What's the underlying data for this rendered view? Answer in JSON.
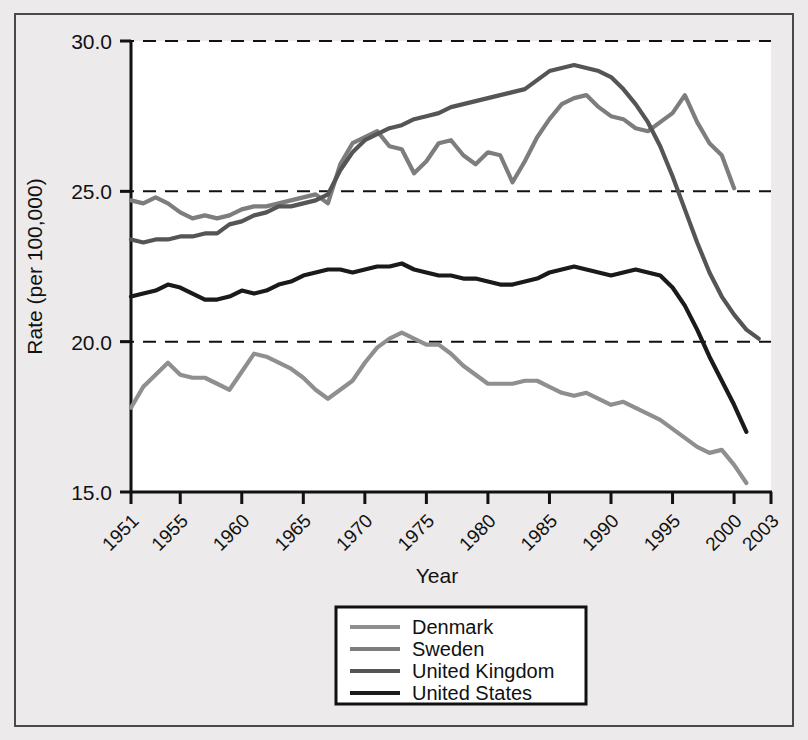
{
  "chart_data": {
    "type": "line",
    "title": "",
    "xlabel": "Year",
    "ylabel": "Rate (per 100,000)",
    "xlim": [
      1951,
      2003
    ],
    "ylim": [
      15.0,
      30.0
    ],
    "grid": true,
    "gridlines_y": [
      15.0,
      20.0,
      25.0,
      30.0
    ],
    "y_tick_labels": [
      "30.0",
      "25.0",
      "20.0",
      "15.0"
    ],
    "y_ticks": [
      30.0,
      25.0,
      20.0,
      15.0
    ],
    "x_tick_labels": [
      "1951",
      "1955",
      "1960",
      "1965",
      "1970",
      "1975",
      "1980",
      "1985",
      "1990",
      "1995",
      "2000",
      "2003"
    ],
    "x_ticks": [
      1951,
      1955,
      1960,
      1965,
      1970,
      1975,
      1980,
      1985,
      1990,
      1995,
      2000,
      2003
    ],
    "legend_position": "bottom-center",
    "series": [
      {
        "name": "Denmark",
        "color": "#8f8f8f",
        "x": [
          1951,
          1952,
          1953,
          1954,
          1955,
          1956,
          1957,
          1958,
          1959,
          1960,
          1961,
          1962,
          1963,
          1964,
          1965,
          1966,
          1967,
          1968,
          1969,
          1970,
          1971,
          1972,
          1973,
          1974,
          1975,
          1976,
          1977,
          1978,
          1979,
          1980,
          1981,
          1982,
          1983,
          1984,
          1985,
          1986,
          1987,
          1988,
          1989,
          1990,
          1991,
          1992,
          1993,
          1994,
          1995,
          1996,
          1997,
          1998,
          1999,
          2000,
          2001
        ],
        "values": [
          17.8,
          18.5,
          18.9,
          19.3,
          18.9,
          18.8,
          18.8,
          18.6,
          18.4,
          19.0,
          19.6,
          19.5,
          19.3,
          19.1,
          18.8,
          18.4,
          18.1,
          18.4,
          18.7,
          19.3,
          19.8,
          20.1,
          20.3,
          20.1,
          19.9,
          19.9,
          19.6,
          19.2,
          18.9,
          18.6,
          18.6,
          18.6,
          18.7,
          18.7,
          18.5,
          18.3,
          18.2,
          18.3,
          18.1,
          17.9,
          18.0,
          17.8,
          17.6,
          17.4,
          17.1,
          16.8,
          16.5,
          16.3,
          16.4,
          15.9,
          15.3
        ]
      },
      {
        "name": "Sweden",
        "color": "#7d7d7d",
        "x": [
          1951,
          1952,
          1953,
          1954,
          1955,
          1956,
          1957,
          1958,
          1959,
          1960,
          1961,
          1962,
          1963,
          1964,
          1965,
          1966,
          1967,
          1968,
          1969,
          1970,
          1971,
          1972,
          1973,
          1974,
          1975,
          1976,
          1977,
          1978,
          1979,
          1980,
          1981,
          1982,
          1983,
          1984,
          1985,
          1986,
          1987,
          1988,
          1989,
          1990,
          1991,
          1992,
          1993,
          1994,
          1995,
          1996,
          1997,
          1998,
          1999,
          2000
        ],
        "values": [
          24.7,
          24.6,
          24.8,
          24.6,
          24.3,
          24.1,
          24.2,
          24.1,
          24.2,
          24.4,
          24.5,
          24.5,
          24.6,
          24.7,
          24.8,
          24.9,
          24.6,
          25.9,
          26.6,
          26.8,
          27.0,
          26.5,
          26.4,
          25.6,
          26.0,
          26.6,
          26.7,
          26.2,
          25.9,
          26.3,
          26.2,
          25.3,
          26.0,
          26.8,
          27.4,
          27.9,
          28.1,
          28.2,
          27.8,
          27.5,
          27.4,
          27.1,
          27.0,
          27.3,
          27.6,
          28.2,
          27.3,
          26.6,
          26.2,
          25.1
        ]
      },
      {
        "name": "United Kingdom",
        "color": "#555555",
        "x": [
          1951,
          1952,
          1953,
          1954,
          1955,
          1956,
          1957,
          1958,
          1959,
          1960,
          1961,
          1962,
          1963,
          1964,
          1965,
          1966,
          1967,
          1968,
          1969,
          1970,
          1971,
          1972,
          1973,
          1974,
          1975,
          1976,
          1977,
          1978,
          1979,
          1980,
          1981,
          1982,
          1983,
          1984,
          1985,
          1986,
          1987,
          1988,
          1989,
          1990,
          1991,
          1992,
          1993,
          1994,
          1995,
          1996,
          1997,
          1998,
          1999,
          2000,
          2001,
          2002
        ],
        "values": [
          23.4,
          23.3,
          23.4,
          23.4,
          23.5,
          23.5,
          23.6,
          23.6,
          23.9,
          24.0,
          24.2,
          24.3,
          24.5,
          24.5,
          24.6,
          24.7,
          24.9,
          25.7,
          26.3,
          26.7,
          26.9,
          27.1,
          27.2,
          27.4,
          27.5,
          27.6,
          27.8,
          27.9,
          28.0,
          28.1,
          28.2,
          28.3,
          28.4,
          28.7,
          29.0,
          29.1,
          29.2,
          29.1,
          29.0,
          28.8,
          28.4,
          27.9,
          27.3,
          26.5,
          25.5,
          24.4,
          23.3,
          22.3,
          21.5,
          20.9,
          20.4,
          20.1
        ]
      },
      {
        "name": "United States",
        "color": "#1a1a1a",
        "x": [
          1951,
          1952,
          1953,
          1954,
          1955,
          1956,
          1957,
          1958,
          1959,
          1960,
          1961,
          1962,
          1963,
          1964,
          1965,
          1966,
          1967,
          1968,
          1969,
          1970,
          1971,
          1972,
          1973,
          1974,
          1975,
          1976,
          1977,
          1978,
          1979,
          1980,
          1981,
          1982,
          1983,
          1984,
          1985,
          1986,
          1987,
          1988,
          1989,
          1990,
          1991,
          1992,
          1993,
          1994,
          1995,
          1996,
          1997,
          1998,
          1999,
          2000,
          2001
        ],
        "values": [
          21.5,
          21.6,
          21.7,
          21.9,
          21.8,
          21.6,
          21.4,
          21.4,
          21.5,
          21.7,
          21.6,
          21.7,
          21.9,
          22.0,
          22.2,
          22.3,
          22.4,
          22.4,
          22.3,
          22.4,
          22.5,
          22.5,
          22.6,
          22.4,
          22.3,
          22.2,
          22.2,
          22.1,
          22.1,
          22.0,
          21.9,
          21.9,
          22.0,
          22.1,
          22.3,
          22.4,
          22.5,
          22.4,
          22.3,
          22.2,
          22.3,
          22.4,
          22.3,
          22.2,
          21.8,
          21.2,
          20.4,
          19.5,
          18.7,
          17.9,
          17.0
        ]
      }
    ]
  },
  "legend": {
    "items": [
      {
        "label": "Denmark",
        "color": "#8f8f8f"
      },
      {
        "label": "Sweden",
        "color": "#7d7d7d"
      },
      {
        "label": "United Kingdom",
        "color": "#555555"
      },
      {
        "label": "United States",
        "color": "#1a1a1a"
      }
    ]
  },
  "colors": {
    "background": "#eceaea",
    "plot_background": "#ffffff",
    "frame": "#4a4a4a",
    "axis": "#111111",
    "gridline": "#111111"
  }
}
